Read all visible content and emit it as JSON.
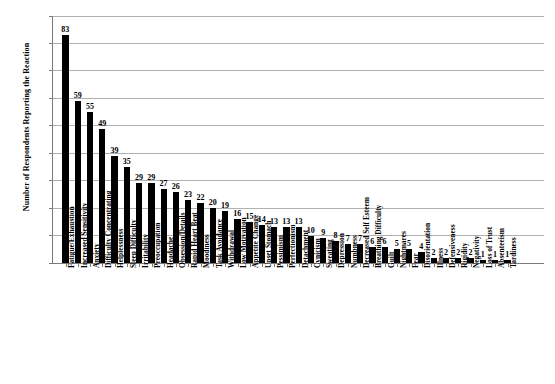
{
  "chart_data": {
    "type": "bar",
    "title": "",
    "xlabel": "",
    "ylabel": "Number of Respondents Reporting the Reaction",
    "ylim": [
      0,
      90
    ],
    "yticks": [
      0,
      10,
      20,
      30,
      40,
      50,
      60,
      70,
      80,
      90
    ],
    "grid": true,
    "legend": "none",
    "bar_color": "#000000",
    "gridline_color": "#b0b0b0",
    "axis_color": "#7a7a7a",
    "background_color": "#ffffff",
    "show_value_labels": true,
    "categories": [
      "Fatigue/Exhaustion",
      "Increased Sensitivity",
      "Anxiety",
      "Difficulty Concentrating",
      "Helplessness",
      "Sleep Difficulty",
      "Irritability",
      "Preoccupation",
      "Headache",
      "Obsession/Details",
      "Rapid Heart Beat",
      "Moodiness",
      "Task Avoidance",
      "Withdrawal",
      "Low Motivation",
      "Appetite Change",
      "Upset Stomach",
      "Pessimism",
      "Perfectionism",
      "Detachment",
      "Cynicism",
      "Sweating",
      "Depression",
      "Numbness",
      "Decreased Self Esteem",
      "Breathing Difficulty",
      "Guilt",
      "Nightmares",
      "Fear",
      "Disorientation",
      "Illness",
      "Defensiveness",
      "Rigidity",
      "Negativity",
      "Loss of Trust",
      "Absenteeism",
      "Tardiness"
    ],
    "values": [
      83,
      59,
      55,
      49,
      39,
      35,
      29,
      29,
      27,
      26,
      23,
      22,
      20,
      19,
      16,
      15,
      14,
      13,
      13,
      13,
      10,
      9,
      8,
      7,
      7,
      6,
      6,
      5,
      5,
      4,
      2,
      2,
      2,
      2,
      1,
      1,
      1
    ]
  }
}
